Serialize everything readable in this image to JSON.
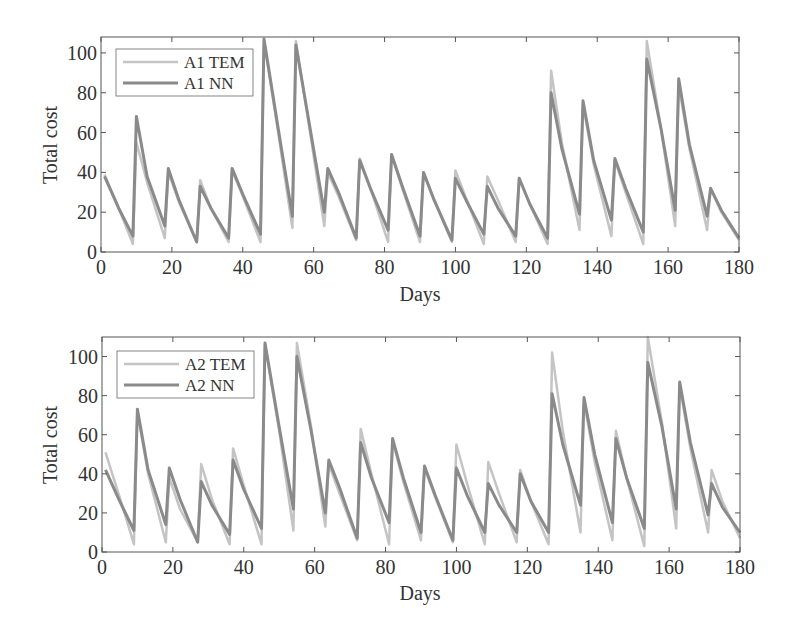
{
  "chart_data": [
    {
      "type": "line",
      "title": "",
      "xlabel": "Days",
      "ylabel": "Total cost",
      "xlim": [
        0,
        180
      ],
      "ylim": [
        0,
        108
      ],
      "xticks": [
        0,
        20,
        40,
        60,
        80,
        100,
        120,
        140,
        160,
        180
      ],
      "yticks": [
        0,
        20,
        40,
        60,
        80,
        100
      ],
      "grid": false,
      "legend_position": "upper left",
      "series": [
        {
          "name": "A1 TEM",
          "color": "#c4c4c4",
          "points": [
            [
              1,
              39
            ],
            [
              5,
              22
            ],
            [
              9,
              4
            ],
            [
              10,
              55
            ],
            [
              13,
              35
            ],
            [
              18,
              7
            ],
            [
              19,
              40
            ],
            [
              22,
              25
            ],
            [
              27,
              5
            ],
            [
              28,
              36
            ],
            [
              31,
              22
            ],
            [
              36,
              5
            ],
            [
              37,
              41
            ],
            [
              40,
              28
            ],
            [
              45,
              5
            ],
            [
              46,
              106
            ],
            [
              50,
              60
            ],
            [
              54,
              12
            ],
            [
              55,
              106
            ],
            [
              59,
              60
            ],
            [
              63,
              13
            ],
            [
              64,
              40
            ],
            [
              67,
              28
            ],
            [
              72,
              6
            ],
            [
              73,
              47
            ],
            [
              76,
              32
            ],
            [
              81,
              5
            ],
            [
              82,
              49
            ],
            [
              85,
              32
            ],
            [
              90,
              5
            ],
            [
              91,
              40
            ],
            [
              94,
              26
            ],
            [
              99,
              5
            ],
            [
              100,
              41
            ],
            [
              103,
              27
            ],
            [
              108,
              4
            ],
            [
              109,
              38
            ],
            [
              112,
              26
            ],
            [
              117,
              5
            ],
            [
              118,
              37
            ],
            [
              121,
              24
            ],
            [
              126,
              4
            ],
            [
              127,
              91
            ],
            [
              130,
              55
            ],
            [
              135,
              11
            ],
            [
              136,
              74
            ],
            [
              139,
              44
            ],
            [
              144,
              8
            ],
            [
              145,
              46
            ],
            [
              148,
              30
            ],
            [
              153,
              4
            ],
            [
              154,
              106
            ],
            [
              158,
              62
            ],
            [
              162,
              13
            ],
            [
              163,
              84
            ],
            [
              166,
              52
            ],
            [
              171,
              11
            ],
            [
              172,
              32
            ],
            [
              175,
              20
            ],
            [
              180,
              6
            ]
          ]
        },
        {
          "name": "A1 NN",
          "color": "#8a8a8a",
          "points": [
            [
              1,
              38
            ],
            [
              5,
              22
            ],
            [
              9,
              8
            ],
            [
              10,
              68
            ],
            [
              13,
              38
            ],
            [
              18,
              13
            ],
            [
              19,
              42
            ],
            [
              22,
              26
            ],
            [
              27,
              5
            ],
            [
              28,
              33
            ],
            [
              31,
              22
            ],
            [
              36,
              7
            ],
            [
              37,
              42
            ],
            [
              40,
              29
            ],
            [
              45,
              9
            ],
            [
              46,
              107
            ],
            [
              50,
              62
            ],
            [
              54,
              18
            ],
            [
              55,
              104
            ],
            [
              59,
              62
            ],
            [
              63,
              20
            ],
            [
              64,
              42
            ],
            [
              67,
              30
            ],
            [
              72,
              7
            ],
            [
              73,
              46
            ],
            [
              76,
              32
            ],
            [
              81,
              11
            ],
            [
              82,
              49
            ],
            [
              85,
              33
            ],
            [
              90,
              8
            ],
            [
              91,
              40
            ],
            [
              94,
              26
            ],
            [
              99,
              6
            ],
            [
              100,
              37
            ],
            [
              103,
              26
            ],
            [
              108,
              9
            ],
            [
              109,
              33
            ],
            [
              112,
              22
            ],
            [
              117,
              8
            ],
            [
              118,
              37
            ],
            [
              121,
              24
            ],
            [
              126,
              7
            ],
            [
              127,
              80
            ],
            [
              130,
              52
            ],
            [
              135,
              19
            ],
            [
              136,
              76
            ],
            [
              139,
              46
            ],
            [
              144,
              16
            ],
            [
              145,
              47
            ],
            [
              148,
              32
            ],
            [
              153,
              10
            ],
            [
              154,
              97
            ],
            [
              158,
              62
            ],
            [
              162,
              21
            ],
            [
              163,
              87
            ],
            [
              166,
              54
            ],
            [
              171,
              18
            ],
            [
              172,
              32
            ],
            [
              175,
              21
            ],
            [
              180,
              7
            ]
          ]
        }
      ]
    },
    {
      "type": "line",
      "title": "",
      "xlabel": "Days",
      "ylabel": "Total cost",
      "xlim": [
        0,
        180
      ],
      "ylim": [
        0,
        110
      ],
      "xticks": [
        0,
        20,
        40,
        60,
        80,
        100,
        120,
        140,
        160,
        180
      ],
      "yticks": [
        0,
        20,
        40,
        60,
        80,
        100
      ],
      "grid": false,
      "legend_position": "upper left",
      "series": [
        {
          "name": "A2 TEM",
          "color": "#c4c4c4",
          "points": [
            [
              1,
              51
            ],
            [
              5,
              28
            ],
            [
              9,
              4
            ],
            [
              10,
              72
            ],
            [
              13,
              40
            ],
            [
              18,
              5
            ],
            [
              19,
              38
            ],
            [
              22,
              22
            ],
            [
              27,
              5
            ],
            [
              28,
              45
            ],
            [
              31,
              27
            ],
            [
              36,
              4
            ],
            [
              37,
              53
            ],
            [
              40,
              34
            ],
            [
              45,
              4
            ],
            [
              46,
              106
            ],
            [
              50,
              62
            ],
            [
              54,
              11
            ],
            [
              55,
              107
            ],
            [
              59,
              64
            ],
            [
              63,
              13
            ],
            [
              64,
              45
            ],
            [
              67,
              30
            ],
            [
              72,
              6
            ],
            [
              73,
              63
            ],
            [
              76,
              40
            ],
            [
              81,
              4
            ],
            [
              82,
              57
            ],
            [
              85,
              36
            ],
            [
              90,
              6
            ],
            [
              91,
              43
            ],
            [
              94,
              28
            ],
            [
              99,
              5
            ],
            [
              100,
              55
            ],
            [
              103,
              35
            ],
            [
              108,
              4
            ],
            [
              109,
              46
            ],
            [
              112,
              30
            ],
            [
              117,
              5
            ],
            [
              118,
              42
            ],
            [
              121,
              26
            ],
            [
              126,
              4
            ],
            [
              127,
              102
            ],
            [
              130,
              62
            ],
            [
              135,
              10
            ],
            [
              136,
              77
            ],
            [
              139,
              46
            ],
            [
              144,
              6
            ],
            [
              145,
              62
            ],
            [
              148,
              38
            ],
            [
              153,
              3
            ],
            [
              154,
              110
            ],
            [
              158,
              66
            ],
            [
              162,
              12
            ],
            [
              163,
              85
            ],
            [
              166,
              53
            ],
            [
              171,
              10
            ],
            [
              172,
              42
            ],
            [
              175,
              26
            ],
            [
              180,
              7
            ]
          ]
        },
        {
          "name": "A2 NN",
          "color": "#8a8a8a",
          "points": [
            [
              1,
              42
            ],
            [
              5,
              26
            ],
            [
              9,
              11
            ],
            [
              10,
              73
            ],
            [
              13,
              42
            ],
            [
              18,
              14
            ],
            [
              19,
              43
            ],
            [
              22,
              27
            ],
            [
              27,
              5
            ],
            [
              28,
              36
            ],
            [
              31,
              24
            ],
            [
              36,
              9
            ],
            [
              37,
              47
            ],
            [
              40,
              32
            ],
            [
              45,
              12
            ],
            [
              46,
              107
            ],
            [
              50,
              64
            ],
            [
              54,
              22
            ],
            [
              55,
              100
            ],
            [
              59,
              62
            ],
            [
              63,
              20
            ],
            [
              64,
              47
            ],
            [
              67,
              33
            ],
            [
              72,
              7
            ],
            [
              73,
              56
            ],
            [
              76,
              38
            ],
            [
              81,
              15
            ],
            [
              82,
              58
            ],
            [
              85,
              38
            ],
            [
              90,
              10
            ],
            [
              91,
              44
            ],
            [
              94,
              29
            ],
            [
              99,
              6
            ],
            [
              100,
              43
            ],
            [
              103,
              29
            ],
            [
              108,
              10
            ],
            [
              109,
              35
            ],
            [
              112,
              24
            ],
            [
              117,
              10
            ],
            [
              118,
              40
            ],
            [
              121,
              26
            ],
            [
              126,
              10
            ],
            [
              127,
              81
            ],
            [
              130,
              55
            ],
            [
              135,
              24
            ],
            [
              136,
              79
            ],
            [
              139,
              50
            ],
            [
              144,
              15
            ],
            [
              145,
              58
            ],
            [
              148,
              38
            ],
            [
              153,
              12
            ],
            [
              154,
              97
            ],
            [
              158,
              64
            ],
            [
              162,
              22
            ],
            [
              163,
              87
            ],
            [
              166,
              56
            ],
            [
              171,
              19
            ],
            [
              172,
              35
            ],
            [
              175,
              23
            ],
            [
              180,
              10
            ]
          ]
        }
      ]
    }
  ],
  "figure": {
    "panels": [
      {
        "legend": [
          "A1 TEM",
          "A1 NN"
        ],
        "xlabel": "Days",
        "ylabel": "Total cost"
      },
      {
        "legend": [
          "A2 TEM",
          "A2 NN"
        ],
        "xlabel": "Days",
        "ylabel": "Total cost"
      }
    ],
    "axis_color": "#555555",
    "text_color": "#333333"
  }
}
